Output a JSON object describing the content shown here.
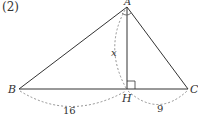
{
  "problem_label": "(2)",
  "figure": {
    "type": "right-triangle-with-altitude",
    "vertices": {
      "apex": "A",
      "left": "B",
      "right": "C",
      "foot": "H"
    },
    "altitude_label": "x",
    "segment_BH": "16",
    "segment_HC": "9",
    "right_angle_at": "H",
    "right_angle_marked_at_A": true,
    "colors": {
      "line": "#333333",
      "dashed": "#777777"
    }
  }
}
